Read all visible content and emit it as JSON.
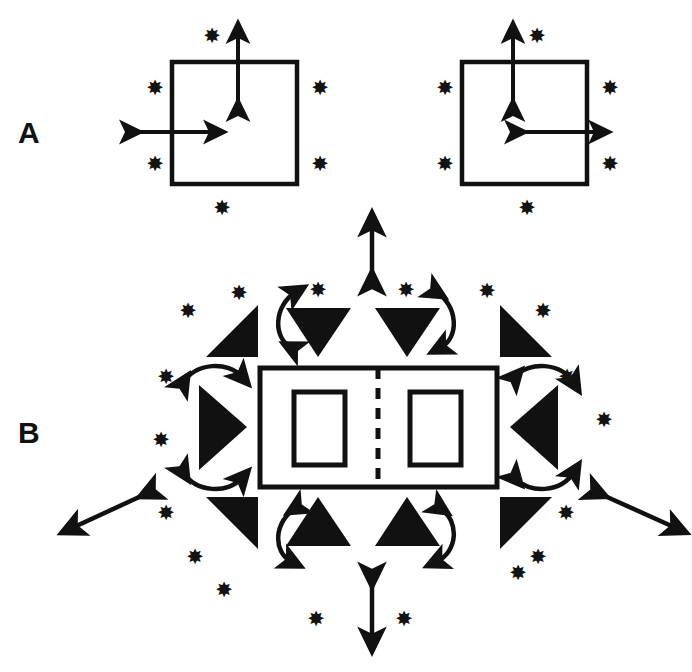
{
  "figure": {
    "background_color": "#ffffff",
    "ink_color": "#111111",
    "width": 692,
    "height": 672
  },
  "panels": [
    {
      "id": "A",
      "label": "A",
      "label_x": 18,
      "label_y": 118,
      "description": "Two square cells with internal double-headed arrows and surrounding starburst markers"
    },
    {
      "id": "B",
      "label": "B",
      "label_x": 18,
      "label_y": 418,
      "description": "Central two-compartment rectangle with dashed midline, surrounded by solid triangles, curved double-headed arrows and starburst markers"
    }
  ],
  "icons": {
    "star": "starburst-icon",
    "star_glyph": "✸",
    "triangle": "solid-triangle-icon",
    "arrow": "double-headed-arrow-icon",
    "curved_arrow": "curved-double-headed-arrow-icon",
    "dashed_line": "dashed-midline-icon"
  },
  "panel_a": {
    "squares": [
      {
        "name": "left-square",
        "x": 172,
        "y": 62,
        "width": 125,
        "height": 122,
        "vertical_arrow": {
          "x": 238,
          "y1": 32,
          "y2": 110
        },
        "horizontal_arrow": {
          "y": 132,
          "x1": 131,
          "x2": 215
        }
      },
      {
        "name": "right-square",
        "x": 462,
        "y": 62,
        "width": 125,
        "height": 122,
        "vertical_arrow": {
          "x": 513,
          "y1": 32,
          "y2": 110
        },
        "horizontal_arrow": {
          "y": 132,
          "x1": 516,
          "x2": 600
        }
      }
    ],
    "stars": [
      {
        "x": 212,
        "y": 36
      },
      {
        "x": 155,
        "y": 88
      },
      {
        "x": 320,
        "y": 88
      },
      {
        "x": 155,
        "y": 164
      },
      {
        "x": 320,
        "y": 164
      },
      {
        "x": 222,
        "y": 208
      },
      {
        "x": 537,
        "y": 36
      },
      {
        "x": 445,
        "y": 88
      },
      {
        "x": 610,
        "y": 88
      },
      {
        "x": 445,
        "y": 164
      },
      {
        "x": 610,
        "y": 164
      },
      {
        "x": 527,
        "y": 208
      }
    ]
  },
  "panel_b": {
    "outer_rect": {
      "x": 260,
      "y": 368,
      "width": 237,
      "height": 119
    },
    "dashed_midline": {
      "x": 378,
      "y1": 368,
      "y2": 487
    },
    "inner_rects": [
      {
        "name": "left-inner-rect",
        "x": 294,
        "y": 392,
        "width": 51,
        "height": 73
      },
      {
        "name": "right-inner-rect",
        "x": 410,
        "y": 392,
        "width": 51,
        "height": 73
      }
    ],
    "triangles": [
      {
        "name": "triangle-top-left-corner",
        "orientation": "up-right-wedge"
      },
      {
        "name": "triangle-top-left-inner",
        "orientation": "down"
      },
      {
        "name": "triangle-top-right-inner",
        "orientation": "down"
      },
      {
        "name": "triangle-top-right-corner",
        "orientation": "up-left-wedge"
      },
      {
        "name": "triangle-left-middle",
        "orientation": "right"
      },
      {
        "name": "triangle-right-middle",
        "orientation": "left"
      },
      {
        "name": "triangle-bottom-left-corner",
        "orientation": "down-right-wedge"
      },
      {
        "name": "triangle-bottom-left-inner",
        "orientation": "up"
      },
      {
        "name": "triangle-bottom-right-inner",
        "orientation": "up"
      },
      {
        "name": "triangle-bottom-right-corner",
        "orientation": "down-left-wedge"
      }
    ],
    "straight_arrows": [
      {
        "name": "arrow-top",
        "type": "vertical"
      },
      {
        "name": "arrow-bottom",
        "type": "vertical"
      },
      {
        "name": "arrow-left-diagonal",
        "type": "diagonal"
      },
      {
        "name": "arrow-right-diagonal",
        "type": "diagonal"
      }
    ],
    "curved_arrows": [
      {
        "name": "curved-arrow-top-left"
      },
      {
        "name": "curved-arrow-top-right"
      },
      {
        "name": "curved-arrow-left-upper"
      },
      {
        "name": "curved-arrow-left-lower"
      },
      {
        "name": "curved-arrow-right-upper"
      },
      {
        "name": "curved-arrow-right-lower"
      },
      {
        "name": "curved-arrow-bottom-left"
      },
      {
        "name": "curved-arrow-bottom-right"
      }
    ],
    "stars": [
      {
        "x": 239,
        "y": 293
      },
      {
        "x": 318,
        "y": 290
      },
      {
        "x": 406,
        "y": 290
      },
      {
        "x": 487,
        "y": 291
      },
      {
        "x": 188,
        "y": 311
      },
      {
        "x": 543,
        "y": 311
      },
      {
        "x": 166,
        "y": 377
      },
      {
        "x": 567,
        "y": 377
      },
      {
        "x": 161,
        "y": 440
      },
      {
        "x": 604,
        "y": 420
      },
      {
        "x": 166,
        "y": 513
      },
      {
        "x": 566,
        "y": 513
      },
      {
        "x": 195,
        "y": 557
      },
      {
        "x": 538,
        "y": 557
      },
      {
        "x": 224,
        "y": 590
      },
      {
        "x": 518,
        "y": 573
      },
      {
        "x": 316,
        "y": 619
      },
      {
        "x": 404,
        "y": 619
      }
    ]
  }
}
